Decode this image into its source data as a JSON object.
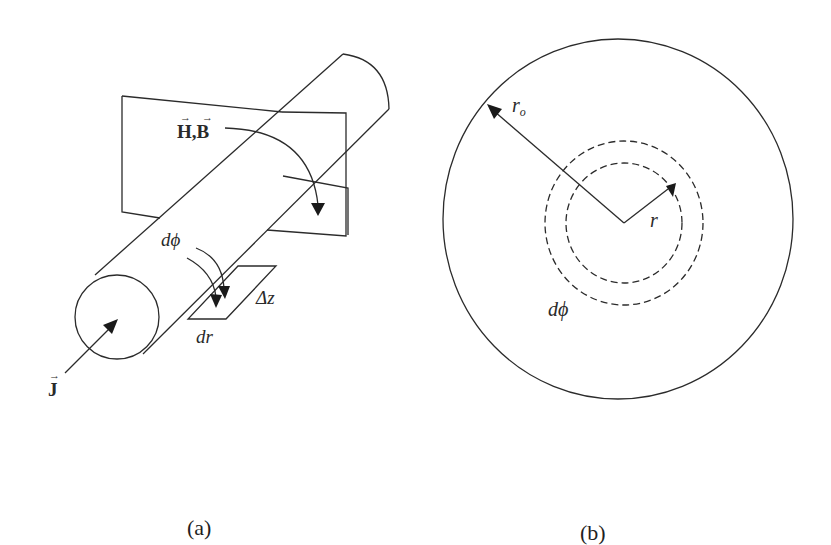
{
  "figure": {
    "panel_a": {
      "caption": "(a)",
      "labels": {
        "field": "H, B",
        "field_h": "H",
        "field_sep": ",",
        "field_b": "B",
        "d_phi": "dϕ",
        "delta_z": "Δz",
        "dr": "dr",
        "current_density": "J"
      },
      "elements": [
        "cylinder",
        "vertical-plane",
        "field-arc-arrow",
        "current-arrow",
        "surface-element",
        "dphi-double-arrow"
      ]
    },
    "panel_b": {
      "caption": "(b)",
      "labels": {
        "outer_radius": "r",
        "outer_radius_sub": "o",
        "radius": "r",
        "d_phi": "dϕ"
      },
      "elements": [
        "outer-circle",
        "inner-dashed-circle",
        "outer-dashed-circle",
        "outer-radius-arrow",
        "radius-arrow"
      ]
    }
  }
}
